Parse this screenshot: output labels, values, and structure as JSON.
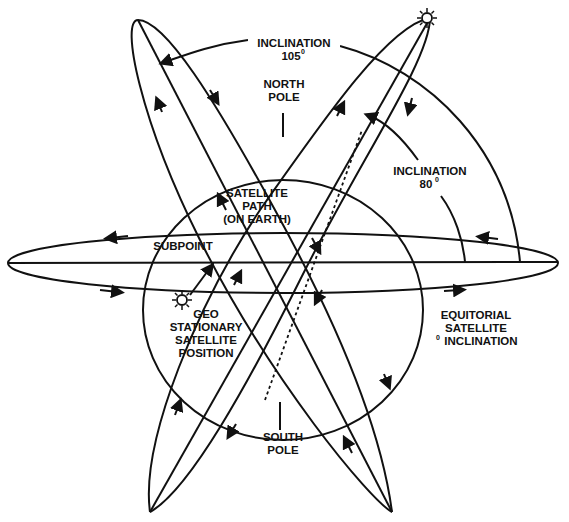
{
  "diagram": {
    "type": "satellite-orbit-inclination",
    "colors": {
      "stroke": "#111111",
      "background": "#ffffff"
    },
    "labels": {
      "inclination_105": {
        "line1": "INCLINATION",
        "line2": "105",
        "sup": "0"
      },
      "north_pole": {
        "line1": "NORTH",
        "line2": "POLE"
      },
      "inclination_80": {
        "line1": "INCLINATION",
        "line2": "80",
        "sup": "0"
      },
      "satellite_path": {
        "line1": "SATELLITE",
        "line2": "PATH",
        "line3": "(ON EARTH)"
      },
      "subpoint": {
        "line1": "SUBPOINT"
      },
      "geo_stationary": {
        "line1": "GEO",
        "line2": "STATIONARY",
        "line3": "SATELLITE",
        "line4": "POSITION"
      },
      "equatorial": {
        "line1": "EQUITORIAL",
        "line2": "SATELLITE",
        "line3_sup": "0",
        "line3": "INCLINATION"
      },
      "south_pole": {
        "line1": "SOUTH",
        "line2": "POLE"
      }
    },
    "icons": [
      "satellite-sun-icon-top",
      "satellite-sun-icon-geo"
    ]
  }
}
